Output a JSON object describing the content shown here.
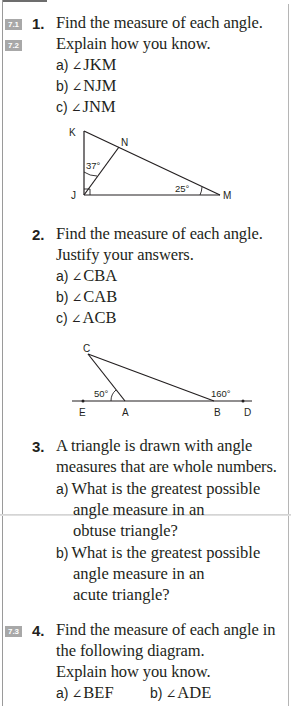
{
  "page": {
    "questions": [
      {
        "number": "1.",
        "tags": [
          "7.1",
          "7.2"
        ],
        "lines": [
          "Find the measure of each angle.",
          "Explain how you know."
        ],
        "parts": [
          {
            "label": "a)",
            "angle_symbol": "∠",
            "text": "JKM"
          },
          {
            "label": "b)",
            "angle_symbol": "∠",
            "text": "NJM"
          },
          {
            "label": "c)",
            "angle_symbol": "∠",
            "text": "JNM"
          }
        ],
        "diagram": {
          "vertices": {
            "K": "K",
            "N": "N",
            "J": "J",
            "M": "M"
          },
          "angle_labels": {
            "KJN": "37°",
            "JMK": "25°"
          }
        }
      },
      {
        "number": "2.",
        "lines": [
          "Find the measure of each angle.",
          "Justify your answers."
        ],
        "parts": [
          {
            "label": "a)",
            "angle_symbol": "∠",
            "text": "CBA"
          },
          {
            "label": "b)",
            "angle_symbol": "∠",
            "text": "CAB"
          },
          {
            "label": "c)",
            "angle_symbol": "∠",
            "text": "ACB"
          }
        ],
        "diagram": {
          "vertices": {
            "C": "C",
            "E": "E",
            "A": "A",
            "B": "B",
            "D": "D"
          },
          "angle_labels": {
            "CAE": "50°",
            "CBD": "160°"
          }
        }
      },
      {
        "number": "3.",
        "lines": [
          "A triangle is drawn with angle",
          "measures that are whole numbers."
        ],
        "parts": [
          {
            "label": "a)",
            "lines": [
              "What is the greatest possible",
              "angle measure in an",
              "obtuse triangle?"
            ]
          },
          {
            "label": "b)",
            "lines": [
              "What is the greatest possible",
              "angle measure in an",
              "acute triangle?"
            ]
          }
        ]
      },
      {
        "number": "4.",
        "tags": [
          "7.3"
        ],
        "lines": [
          "Find the measure of each angle in",
          "the following diagram.",
          "Explain how you know."
        ],
        "parts": [
          {
            "label": "a)",
            "angle_symbol": "∠",
            "text": "BEF"
          },
          {
            "label": "b)",
            "angle_symbol": "∠",
            "text": "ADE"
          }
        ]
      }
    ]
  }
}
